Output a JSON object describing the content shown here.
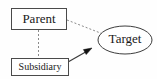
{
  "diagram": {
    "type": "node-link-diagram",
    "width": 157,
    "height": 79,
    "background_color": "#fefefe",
    "nodes": [
      {
        "id": "parent",
        "label": "Parent",
        "shape": "rectangle",
        "x": 11,
        "y": 8,
        "width": 55,
        "height": 22,
        "text_color": "#1a1a1a",
        "border_color": "#4a4a4a",
        "fill_color": "#ffffff"
      },
      {
        "id": "subsidiary",
        "label": "Subsidiary",
        "shape": "rectangle",
        "x": 11,
        "y": 58,
        "width": 57,
        "height": 18,
        "text_color": "#1a1a1a",
        "border_color": "#4a4a4a",
        "fill_color": "#ffffff"
      },
      {
        "id": "target",
        "label": "Target",
        "shape": "ellipse",
        "cx": 125,
        "cy": 40,
        "rx": 27,
        "ry": 14,
        "text_color": "#1a1a1a",
        "border_color": "#3d3d3d",
        "fill_color": "#ffffff"
      }
    ],
    "edges": [
      {
        "id": "parent-target",
        "from": "parent",
        "to": "target",
        "style": "dashed",
        "arrow": "none",
        "color": "#8a8a8a"
      },
      {
        "id": "parent-subsidiary",
        "from": "parent",
        "to": "subsidiary",
        "style": "dashed",
        "arrow": "none",
        "color": "#8a8a8a"
      },
      {
        "id": "subsidiary-target",
        "from": "subsidiary",
        "to": "target",
        "style": "solid",
        "arrow": "filled-triangle",
        "color": "#3a3a3a"
      }
    ]
  }
}
